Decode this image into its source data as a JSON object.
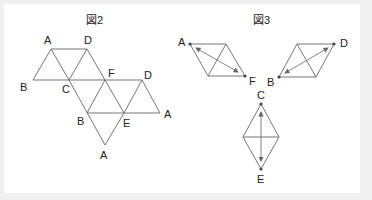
{
  "figure2": {
    "title": "図2",
    "labels": {
      "a_top": "A",
      "d_top": "D",
      "b_left": "B",
      "c": "C",
      "f": "F",
      "d_right": "D",
      "b_mid": "B",
      "e": "E",
      "a_right": "A",
      "a_bottom": "A"
    }
  },
  "figure3": {
    "title": "図3",
    "labels": {
      "a": "A",
      "f": "F",
      "d": "D",
      "b": "B",
      "c": "C",
      "e": "E"
    }
  },
  "colors": {
    "line": "#555555",
    "arrow": "#777777",
    "dot": "#444444",
    "background": "#f0f0f0",
    "panel": "#ffffff"
  }
}
